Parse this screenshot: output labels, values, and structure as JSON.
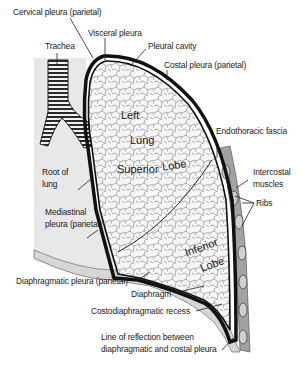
{
  "diagram": {
    "labels": {
      "cervical_pleura": "Cervical pleura (parietal)",
      "visceral_pleura": "Visceral pleura",
      "trachea": "Trachea",
      "pleural_cavity": "Pleural cavity",
      "costal_pleura": "Costal pleura (parietal)",
      "endothoracic_fascia": "Endothoracic fascia",
      "intercostal_muscles_1": "Intercostal",
      "intercostal_muscles_2": "muscles",
      "ribs": "Ribs",
      "root_of_lung_1": "Root of",
      "root_of_lung_2": "lung",
      "mediastinal_pleura_1": "Mediastinal",
      "mediastinal_pleura_2": "pleura (parietal)",
      "diaphragmatic_pleura": "Diaphragmatic pleura (parietal)",
      "diaphragm": "Diaphragm",
      "costodiaphragmatic_recess": "Costodiaphragmatic recess",
      "line_of_reflection_1": "Line of reflection between",
      "line_of_reflection_2": "diaphragmatic and costal pleura"
    },
    "lung_text": {
      "left": "Left",
      "lung": "Lung",
      "superior": "Superior",
      "lobe_sup": "Lobe",
      "inferior": "Inferior",
      "lobe_inf": "Lobe"
    },
    "colors": {
      "pleura": "#111111",
      "tissue": "#f4f4f4",
      "mediastinum": "#e6e6e6",
      "muscle": "#9a9a9a",
      "rib": "#cfcfcf"
    }
  }
}
